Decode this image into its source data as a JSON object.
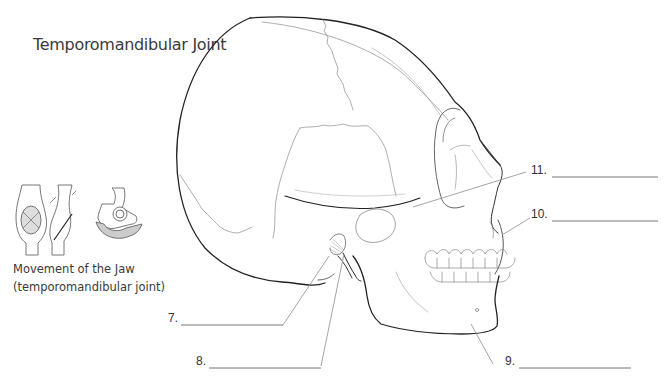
{
  "title": "Temporomandibular Joint",
  "caption": {
    "line1": "Movement of the Jaw",
    "line2": "(temporomandibular joint)"
  },
  "labels": [
    {
      "number": "7.",
      "answer": ""
    },
    {
      "number": "8.",
      "answer": ""
    },
    {
      "number": "9.",
      "answer": ""
    },
    {
      "number": "10.",
      "answer": ""
    },
    {
      "number": "11.",
      "answer": ""
    }
  ],
  "colors": {
    "outline": "#222222",
    "detail": "#8a8a8a",
    "leader": "#9a9a9a",
    "blank_line": "#555555"
  }
}
